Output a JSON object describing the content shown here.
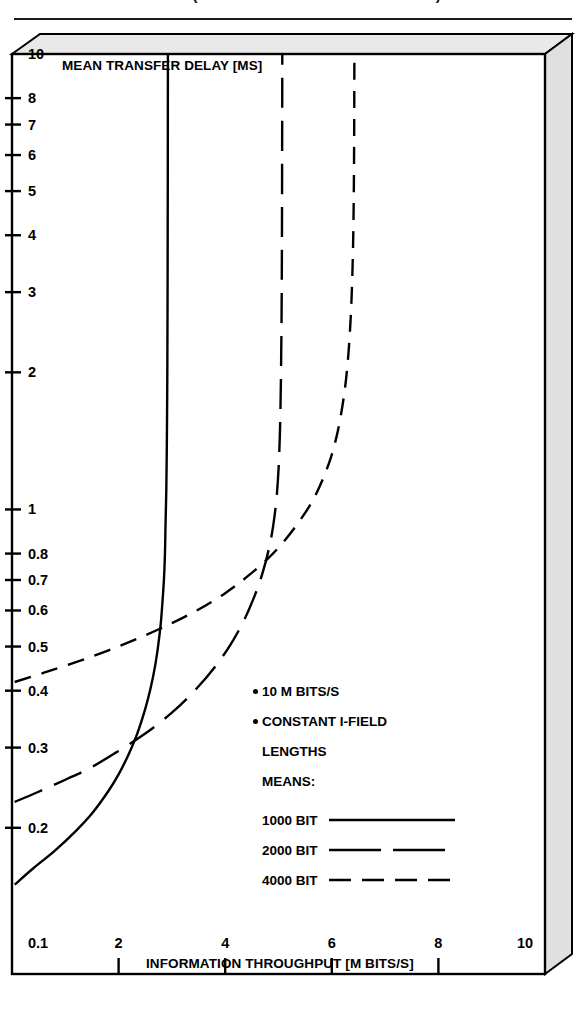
{
  "caption": {
    "text": "FIG. 4  (PARTIALLY CROPPED HEADING)"
  },
  "chart_data": {
    "type": "line",
    "title": "",
    "xlabel": "INFORMATION THROUGHPUT [M BITS/S]",
    "ylabel": "MEAN TRANSFER DELAY [MS]",
    "xscale": "linear",
    "yscale": "log",
    "xlim": [
      0,
      10
    ],
    "ylim": [
      0.1,
      10
    ],
    "grid": false,
    "legend_position": "center-right",
    "x_ticks": [
      {
        "label": "0.1",
        "value": 0.1
      },
      {
        "label": "2",
        "value": 2
      },
      {
        "label": "4",
        "value": 4
      },
      {
        "label": "6",
        "value": 6
      },
      {
        "label": "8",
        "value": 8
      },
      {
        "label": "10",
        "value": 10
      }
    ],
    "y_ticks": [
      {
        "label": "10",
        "value": 10
      },
      {
        "label": "8",
        "value": 8
      },
      {
        "label": "7",
        "value": 7
      },
      {
        "label": "6",
        "value": 6
      },
      {
        "label": "5",
        "value": 5
      },
      {
        "label": "4",
        "value": 4
      },
      {
        "label": "3",
        "value": 3
      },
      {
        "label": "2",
        "value": 2
      },
      {
        "label": "1",
        "value": 1
      },
      {
        "label": "0.8",
        "value": 0.8
      },
      {
        "label": "0.7",
        "value": 0.7
      },
      {
        "label": "0.6",
        "value": 0.6
      },
      {
        "label": "0.5",
        "value": 0.5
      },
      {
        "label": "0.4",
        "value": 0.4
      },
      {
        "label": "0.3",
        "value": 0.3
      },
      {
        "label": "0.2",
        "value": 0.2
      }
    ],
    "annotations": [
      "10 M BITS/S",
      "CONSTANT I-FIELD",
      "LENGTHS",
      "MEANS:"
    ],
    "series": [
      {
        "name": "1000 BIT",
        "style": "solid",
        "asymptote_x": 2.92,
        "points": [
          [
            0.05,
            0.15
          ],
          [
            0.4,
            0.163
          ],
          [
            0.8,
            0.178
          ],
          [
            1.2,
            0.197
          ],
          [
            1.5,
            0.215
          ],
          [
            1.8,
            0.24
          ],
          [
            2.0,
            0.262
          ],
          [
            2.2,
            0.292
          ],
          [
            2.35,
            0.322
          ],
          [
            2.5,
            0.365
          ],
          [
            2.6,
            0.405
          ],
          [
            2.68,
            0.45
          ],
          [
            2.74,
            0.5
          ],
          [
            2.79,
            0.56
          ],
          [
            2.82,
            0.62
          ],
          [
            2.85,
            0.7
          ],
          [
            2.87,
            0.8
          ],
          [
            2.88,
            0.92
          ],
          [
            2.895,
            1.1
          ],
          [
            2.905,
            1.4
          ],
          [
            2.912,
            1.8
          ],
          [
            2.916,
            2.3
          ],
          [
            2.919,
            3.0
          ],
          [
            2.921,
            4.0
          ],
          [
            2.923,
            5.5
          ],
          [
            2.924,
            7.5
          ],
          [
            2.925,
            10.0
          ]
        ]
      },
      {
        "name": "2000 BIT",
        "style": "dash-long",
        "asymptote_x": 5.07,
        "points": [
          [
            0.05,
            0.228
          ],
          [
            0.5,
            0.24
          ],
          [
            1.0,
            0.255
          ],
          [
            1.5,
            0.272
          ],
          [
            2.0,
            0.295
          ],
          [
            2.5,
            0.322
          ],
          [
            3.0,
            0.358
          ],
          [
            3.4,
            0.397
          ],
          [
            3.8,
            0.45
          ],
          [
            4.1,
            0.505
          ],
          [
            4.35,
            0.57
          ],
          [
            4.55,
            0.645
          ],
          [
            4.7,
            0.725
          ],
          [
            4.82,
            0.82
          ],
          [
            4.9,
            0.92
          ],
          [
            4.96,
            1.05
          ],
          [
            5.0,
            1.22
          ],
          [
            5.025,
            1.45
          ],
          [
            5.04,
            1.75
          ],
          [
            5.05,
            2.15
          ],
          [
            5.058,
            2.7
          ],
          [
            5.063,
            3.5
          ],
          [
            5.066,
            4.5
          ],
          [
            5.068,
            6.0
          ],
          [
            5.07,
            8.0
          ],
          [
            5.071,
            10.0
          ]
        ]
      },
      {
        "name": "4000 BIT",
        "style": "dash-medium",
        "asymptote_x": 6.42,
        "points": [
          [
            0.05,
            0.418
          ],
          [
            0.6,
            0.438
          ],
          [
            1.2,
            0.462
          ],
          [
            1.8,
            0.49
          ],
          [
            2.4,
            0.523
          ],
          [
            3.0,
            0.563
          ],
          [
            3.5,
            0.603
          ],
          [
            4.0,
            0.655
          ],
          [
            4.4,
            0.71
          ],
          [
            4.8,
            0.78
          ],
          [
            5.1,
            0.85
          ],
          [
            5.4,
            0.945
          ],
          [
            5.65,
            1.05
          ],
          [
            5.85,
            1.18
          ],
          [
            6.0,
            1.32
          ],
          [
            6.12,
            1.5
          ],
          [
            6.22,
            1.75
          ],
          [
            6.29,
            2.05
          ],
          [
            6.34,
            2.45
          ],
          [
            6.375,
            3.0
          ],
          [
            6.397,
            3.7
          ],
          [
            6.41,
            4.6
          ],
          [
            6.417,
            5.8
          ],
          [
            6.421,
            7.4
          ],
          [
            6.424,
            10.0
          ]
        ]
      }
    ]
  }
}
